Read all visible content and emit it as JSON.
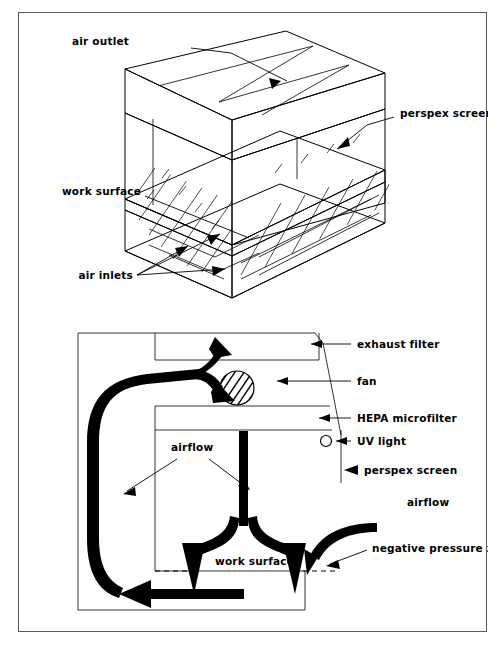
{
  "figure": {
    "title": "",
    "panels": [
      {
        "id": "isometric-cabinet",
        "name": "isometric-view",
        "labels": [
          {
            "key": "air_outlet",
            "text": "air outlet"
          },
          {
            "key": "perspex_screen",
            "text": "perspex screen"
          },
          {
            "key": "work_surface",
            "text": "work surface"
          },
          {
            "key": "air_inlets",
            "text": "air inlets"
          }
        ]
      },
      {
        "id": "cross-section",
        "name": "cross-section-airflow",
        "labels": [
          {
            "key": "exhaust_filter",
            "text": "exhaust filter"
          },
          {
            "key": "fan",
            "text": "fan"
          },
          {
            "key": "hepa_microfilter",
            "text": "HEPA  microfilter"
          },
          {
            "key": "uv_light",
            "text": "UV light"
          },
          {
            "key": "perspex_screen",
            "text": "perspex screen"
          },
          {
            "key": "airflow_left",
            "text": "airflow"
          },
          {
            "key": "airflow_right",
            "text": "airflow"
          },
          {
            "key": "work_surface",
            "text": "work surface"
          },
          {
            "key": "negative_pressure_zone",
            "text": "negative pressure zone"
          }
        ]
      }
    ]
  },
  "colors": {
    "ink": "#000000",
    "frame": "#5a5a5a",
    "background": "#ffffff"
  },
  "top": {
    "air_outlet": "air outlet",
    "perspex_screen": "perspex screen",
    "work_surface": "work surface",
    "air_inlets": "air inlets"
  },
  "bottom": {
    "exhaust_filter": "exhaust filter",
    "fan": "fan",
    "hepa_microfilter": "HEPA  microfilter",
    "uv_light": "UV light",
    "perspex_screen": "perspex screen",
    "airflow_inner": "airflow",
    "airflow_outer": "airflow",
    "work_surface": "work surface",
    "negative_pressure_zone": "negative pressure zone"
  }
}
